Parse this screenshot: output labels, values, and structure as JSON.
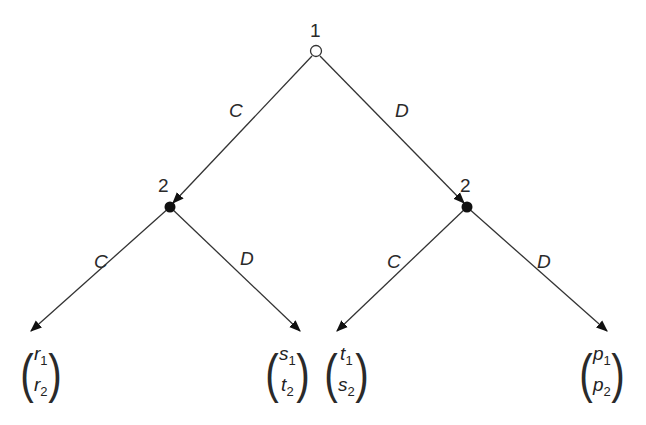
{
  "diagram": {
    "type": "extensive-form game tree",
    "root": {
      "player_label": "1",
      "x": 316,
      "y": 52,
      "style": "hollow"
    },
    "nodes": [
      {
        "id": "left",
        "player_label": "2",
        "x": 170,
        "y": 207,
        "style": "filled"
      },
      {
        "id": "right",
        "player_label": "2",
        "x": 467,
        "y": 207,
        "style": "filled"
      }
    ],
    "edges": {
      "root_left": {
        "label": "C"
      },
      "root_right": {
        "label": "D"
      },
      "left_left": {
        "label": "C"
      },
      "left_right": {
        "label": "D"
      },
      "right_left": {
        "label": "C"
      },
      "right_right": {
        "label": "D"
      }
    },
    "payoffs": [
      {
        "top": "r",
        "top_sub": "1",
        "bottom": "r",
        "bottom_sub": "2"
      },
      {
        "top": "s",
        "top_sub": "1",
        "bottom": "t",
        "bottom_sub": "2"
      },
      {
        "top": "t",
        "top_sub": "1",
        "bottom": "s",
        "bottom_sub": "2"
      },
      {
        "top": "p",
        "top_sub": "1",
        "bottom": "p",
        "bottom_sub": "2"
      }
    ],
    "colors": {
      "line": "#333333",
      "node_fill": "#111111",
      "text": "#2a2a2a"
    }
  }
}
